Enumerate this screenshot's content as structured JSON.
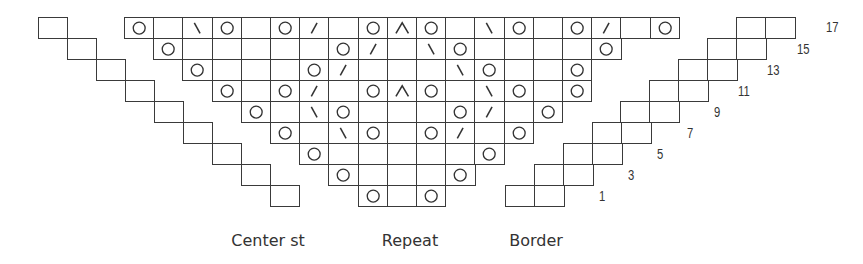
{
  "grid": {
    "origin_x": 124,
    "origin_y": 17,
    "cell_w": 29.2,
    "cell_h": 21,
    "line_color": "#3a3a3a",
    "symbol_color": "#333333"
  },
  "legend_symbols": {
    "O": "yarn-over",
    "\\": "ssk-left-slanting-decrease",
    "/": "k2tog-right-slanting-decrease",
    "^": "centered-double-decrease",
    "": "knit"
  },
  "chart_rows": [
    {
      "row": 17,
      "start_col": 0,
      "cells": [
        "O",
        "",
        "\\",
        "O",
        "",
        "O",
        "/",
        "",
        "O",
        "^",
        "O",
        "",
        "\\",
        "O",
        "",
        "O",
        "/",
        "",
        "O"
      ]
    },
    {
      "row": 15,
      "start_col": 1,
      "cells": [
        "O",
        "",
        "",
        "",
        "",
        "",
        "O",
        "/",
        "",
        "\\",
        "O",
        "",
        "",
        "",
        "",
        "O"
      ]
    },
    {
      "row": 13,
      "start_col": 2,
      "cells": [
        "O",
        "",
        "",
        "",
        "O",
        "/",
        "",
        "",
        "",
        "\\",
        "O",
        "",
        "",
        "O"
      ]
    },
    {
      "row": 11,
      "start_col": 3,
      "cells": [
        "O",
        "",
        "O",
        "/",
        "",
        "O",
        "^",
        "O",
        "",
        "\\",
        "O",
        "",
        "O"
      ]
    },
    {
      "row": 9,
      "start_col": 4,
      "cells": [
        "O",
        "",
        "\\",
        "O",
        "",
        "",
        "",
        "O",
        "/",
        "",
        "O"
      ]
    },
    {
      "row": 7,
      "start_col": 5,
      "cells": [
        "O",
        "",
        "\\",
        "O",
        "",
        "O",
        "/",
        "",
        "O"
      ]
    },
    {
      "row": 5,
      "start_col": 6,
      "cells": [
        "O",
        "",
        "",
        "",
        "",
        "",
        "O"
      ]
    },
    {
      "row": 3,
      "start_col": 7,
      "cells": [
        "O",
        "",
        "",
        "",
        "O"
      ]
    },
    {
      "row": 1,
      "start_col": 8,
      "cells": [
        "O",
        "",
        "O"
      ]
    }
  ],
  "center_stitch_steps": [
    {
      "row": 17,
      "x": 38
    },
    {
      "row": 15,
      "x": 67
    },
    {
      "row": 13,
      "x": 96
    },
    {
      "row": 11,
      "x": 125
    },
    {
      "row": 9,
      "x": 154
    },
    {
      "row": 7,
      "x": 183
    },
    {
      "row": 5,
      "x": 212
    },
    {
      "row": 3,
      "x": 241
    },
    {
      "row": 1,
      "x": 270
    }
  ],
  "border_steps": [
    {
      "row": 17,
      "x": 736
    },
    {
      "row": 15,
      "x": 707
    },
    {
      "row": 13,
      "x": 678
    },
    {
      "row": 11,
      "x": 649
    },
    {
      "row": 9,
      "x": 620
    },
    {
      "row": 7,
      "x": 592
    },
    {
      "row": 5,
      "x": 563
    },
    {
      "row": 3,
      "x": 534
    },
    {
      "row": 1,
      "x": 505
    }
  ],
  "row_numbers": [
    {
      "text": "17",
      "x": 826,
      "y": 19
    },
    {
      "text": "15",
      "x": 797,
      "y": 41
    },
    {
      "text": "13",
      "x": 767,
      "y": 62
    },
    {
      "text": "11",
      "x": 738,
      "y": 83
    },
    {
      "text": "9",
      "x": 714,
      "y": 104
    },
    {
      "text": "7",
      "x": 687,
      "y": 125
    },
    {
      "text": "5",
      "x": 657,
      "y": 146
    },
    {
      "text": "3",
      "x": 628,
      "y": 167
    },
    {
      "text": "1",
      "x": 599,
      "y": 188
    }
  ],
  "section_labels": [
    {
      "text": "Center st",
      "x": 268,
      "y": 231
    },
    {
      "text": "Repeat",
      "x": 410,
      "y": 231
    },
    {
      "text": "Border",
      "x": 536,
      "y": 231
    }
  ]
}
